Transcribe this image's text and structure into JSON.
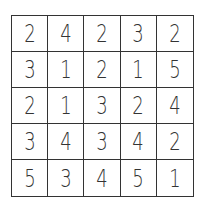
{
  "puzzle": {
    "rows": 5,
    "cols": 5,
    "grid": [
      [
        "2",
        "4",
        "2",
        "3",
        "2"
      ],
      [
        "3",
        "1",
        "2",
        "1",
        "5"
      ],
      [
        "2",
        "1",
        "3",
        "2",
        "4"
      ],
      [
        "3",
        "4",
        "3",
        "4",
        "2"
      ],
      [
        "5",
        "3",
        "4",
        "5",
        "1"
      ]
    ]
  }
}
